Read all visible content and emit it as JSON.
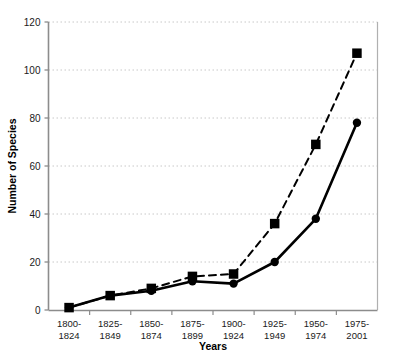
{
  "chart_data": {
    "type": "line",
    "title": "",
    "xlabel": "Years",
    "ylabel": "Number of Species",
    "categories": [
      "1800-1824",
      "1825-1849",
      "1850-1874",
      "1875-1899",
      "1900-1924",
      "1925-1949",
      "1950-1974",
      "1975-2001"
    ],
    "category_lines": [
      [
        "1800-",
        "1824"
      ],
      [
        "1825-",
        "1849"
      ],
      [
        "1850-",
        "1874"
      ],
      [
        "1875-",
        "1899"
      ],
      [
        "1900-",
        "1924"
      ],
      [
        "1925-",
        "1949"
      ],
      [
        "1950-",
        "1974"
      ],
      [
        "1975-",
        "2001"
      ]
    ],
    "series": [
      {
        "name": "solid-series",
        "line_style": "solid",
        "marker": "circle",
        "color": "#000000",
        "values": [
          1,
          6,
          8,
          12,
          11,
          20,
          38,
          78
        ]
      },
      {
        "name": "dashed-series",
        "line_style": "dashed",
        "marker": "square",
        "color": "#000000",
        "values": [
          1,
          6,
          9,
          14,
          15,
          36,
          69,
          107
        ]
      }
    ],
    "ylim": [
      0,
      120
    ],
    "yticks": [
      0,
      20,
      40,
      60,
      80,
      100,
      120
    ],
    "ytick_labels": [
      "0",
      "20",
      "40",
      "60",
      "80",
      "100",
      "120"
    ],
    "grid": true,
    "grid_style": "dotted",
    "grid_color": "#c8c8c8",
    "axis_color": "#808080",
    "legend": "none"
  }
}
